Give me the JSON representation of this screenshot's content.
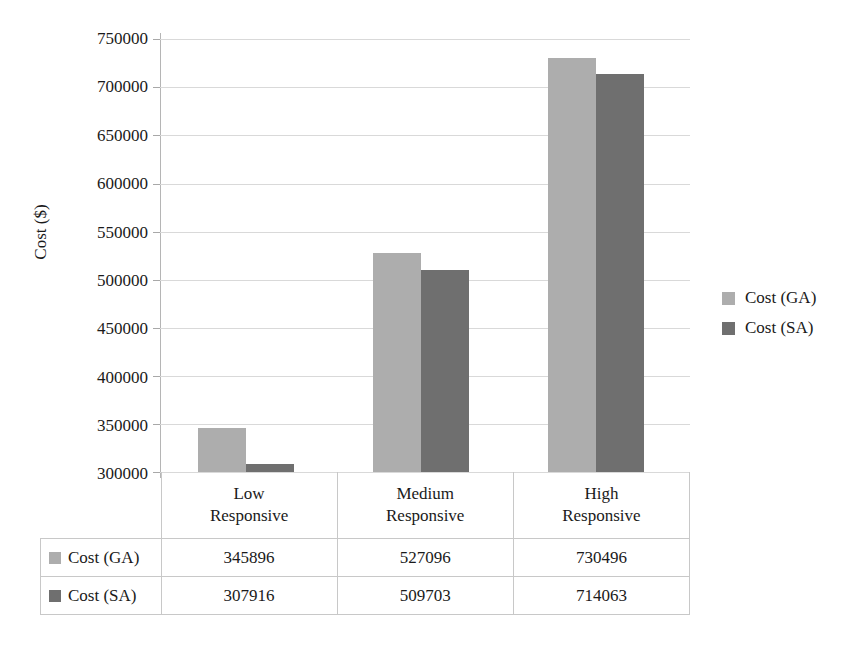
{
  "chart_data": {
    "type": "bar",
    "title": "",
    "xlabel": "",
    "ylabel": "Cost ($)",
    "categories": [
      "Low Responsive",
      "Medium Responsive",
      "High Responsive"
    ],
    "category_lines": [
      [
        "Low",
        "Responsive"
      ],
      [
        "Medium",
        "Responsive"
      ],
      [
        "High",
        "Responsive"
      ]
    ],
    "series": [
      {
        "name": "Cost (GA)",
        "color": "#adadad",
        "values": [
          345896,
          527096,
          730496
        ]
      },
      {
        "name": "Cost (SA)",
        "color": "#6f6f6f",
        "values": [
          307916,
          509703,
          714063
        ]
      }
    ],
    "ylim": [
      300000,
      750000
    ],
    "ytick_step": 50000,
    "ytick_labels": [
      "750000",
      "700000",
      "650000",
      "600000",
      "550000",
      "500000",
      "450000",
      "400000",
      "350000",
      "300000"
    ],
    "ytick_values": [
      750000,
      700000,
      650000,
      600000,
      550000,
      500000,
      450000,
      400000,
      350000,
      300000
    ],
    "grid": true,
    "legend_position": "right",
    "data_table_visible": true
  },
  "legend": {
    "items": [
      {
        "label": "Cost (GA)",
        "color": "#adadad"
      },
      {
        "label": "Cost (SA)",
        "color": "#6f6f6f"
      }
    ]
  },
  "table": {
    "category_headers": [
      "Low Responsive",
      "Medium Responsive",
      "High Responsive"
    ],
    "rows": [
      {
        "label": "Cost (GA)",
        "values": [
          "345896",
          "527096",
          "730496"
        ]
      },
      {
        "label": "Cost (SA)",
        "values": [
          "307916",
          "509703",
          "714063"
        ]
      }
    ]
  },
  "axis": {
    "y_title": "Cost ($)",
    "y_labels": [
      "750000",
      "700000",
      "650000",
      "600000",
      "550000",
      "500000",
      "450000",
      "400000",
      "350000",
      "300000"
    ]
  },
  "categories": {
    "c0_line1": "Low",
    "c0_line2": "Responsive",
    "c1_line1": "Medium",
    "c1_line2": "Responsive",
    "c2_line1": "High",
    "c2_line2": "Responsive"
  }
}
